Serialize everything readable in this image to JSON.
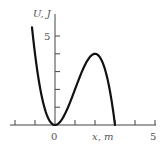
{
  "chart_data": {
    "type": "line",
    "title": "",
    "xlabel": "x, m",
    "ylabel": "U, J",
    "x_ticks": [
      -2,
      -1,
      0,
      1,
      2,
      3,
      4,
      5
    ],
    "x_tick_labels": {
      "0": "0",
      "5": "5"
    },
    "y_ticks": [
      1,
      2,
      3,
      4,
      5
    ],
    "y_tick_labels": {
      "5": "5"
    },
    "xlim": [
      -2.1,
      5.1
    ],
    "ylim": [
      0,
      6
    ],
    "grid": false,
    "series": [
      {
        "name": "U(x)",
        "x": [
          -1.15,
          -1.0,
          -0.75,
          -0.5,
          -0.25,
          0,
          0.25,
          0.5,
          0.75,
          1.0,
          1.25,
          1.5,
          1.75,
          2.0,
          2.25,
          2.5,
          2.75,
          3.0
        ],
        "values": [
          5.5,
          4.0,
          2.11,
          0.88,
          0.2,
          0,
          0.17,
          0.63,
          1.27,
          2.0,
          2.73,
          3.38,
          3.83,
          4.0,
          3.8,
          3.13,
          1.89,
          0
        ]
      }
    ]
  },
  "labels": {
    "ylabel": "U, J",
    "xlabel": "x, m",
    "x_zero": "0",
    "x_five": "5",
    "y_five": "5"
  }
}
